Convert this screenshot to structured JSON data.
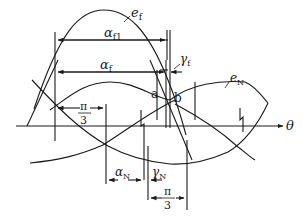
{
  "diagram": {
    "axis_label": "θ",
    "curves": {
      "ef": {
        "base": "e",
        "sub": "f"
      },
      "eN": {
        "base": "e",
        "sub": "N"
      }
    },
    "angles": {
      "alpha_f1": {
        "base": "α",
        "sub": "f1"
      },
      "alpha_f": {
        "base": "α",
        "sub": "f"
      },
      "gamma_f": {
        "base": "γ",
        "sub": "f"
      },
      "alpha_N": {
        "base": "α",
        "sub": "N"
      },
      "gamma_N": {
        "base": "γ",
        "sub": "N"
      },
      "pi_over_3_top": {
        "num": "π",
        "den": "3"
      },
      "pi_over_3_bottom": {
        "num": "π",
        "den": "3"
      }
    },
    "points": {
      "a": "a",
      "b": "b"
    },
    "colors": {
      "line": "#1a1a1a",
      "background": "#ffffff"
    }
  }
}
